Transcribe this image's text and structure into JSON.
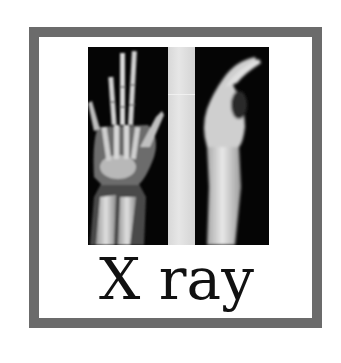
{
  "card": {
    "border_color": "#6b6b6b",
    "background": "#ffffff"
  },
  "image": {
    "subject": "x-ray of hand and wrist",
    "views": [
      {
        "name": "frontal-view",
        "description": "PA view of hand and forearm bones"
      },
      {
        "name": "lateral-view",
        "description": "lateral view of hand and wrist"
      }
    ]
  },
  "caption": {
    "text": "X ray"
  }
}
